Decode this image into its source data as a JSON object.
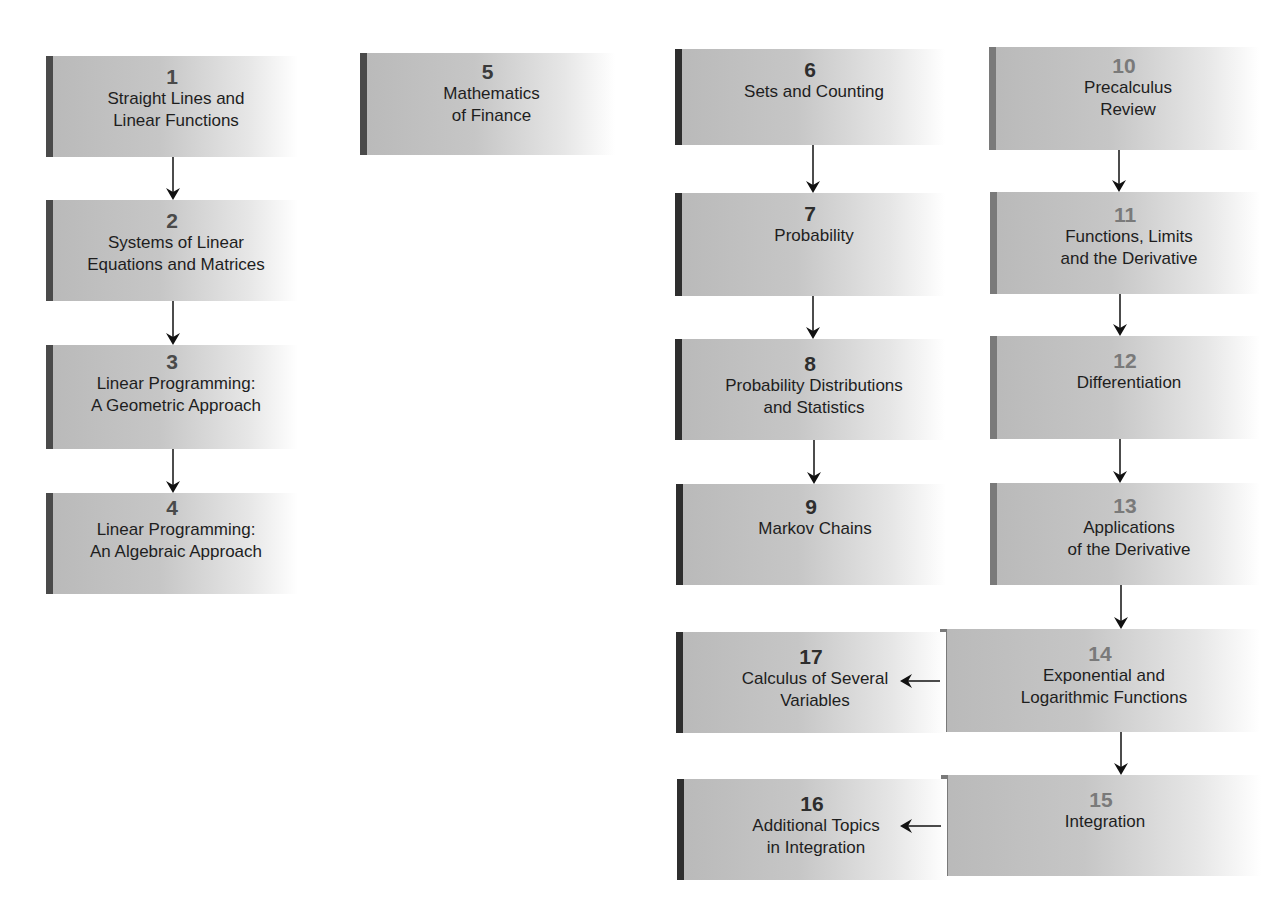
{
  "diagram": {
    "type": "chapter-dependency-flowchart",
    "nodes": [
      {
        "id": "1",
        "number": "1",
        "line1": "Straight Lines and",
        "line2": "Linear Functions",
        "group": "finite-a"
      },
      {
        "id": "2",
        "number": "2",
        "line1": "Systems of Linear",
        "line2": "Equations and Matrices",
        "group": "finite-a"
      },
      {
        "id": "3",
        "number": "3",
        "line1": "Linear Programming:",
        "line2": "A Geometric Approach",
        "group": "finite-a"
      },
      {
        "id": "4",
        "number": "4",
        "line1": "Linear Programming:",
        "line2": "An Algebraic Approach",
        "group": "finite-a"
      },
      {
        "id": "5",
        "number": "5",
        "line1": "Mathematics",
        "line2": "of Finance",
        "group": "finite-b"
      },
      {
        "id": "6",
        "number": "6",
        "line1": "Sets and Counting",
        "line2": "",
        "group": "finite-b"
      },
      {
        "id": "7",
        "number": "7",
        "line1": "Probability",
        "line2": "",
        "group": "finite-b"
      },
      {
        "id": "8",
        "number": "8",
        "line1": "Probability Distributions",
        "line2": "and Statistics",
        "group": "finite-b"
      },
      {
        "id": "9",
        "number": "9",
        "line1": "Markov Chains",
        "line2": "",
        "group": "finite-b"
      },
      {
        "id": "10",
        "number": "10",
        "line1": "Precalculus",
        "line2": "Review",
        "group": "calculus"
      },
      {
        "id": "11",
        "number": "11",
        "line1": "Functions, Limits",
        "line2": "and the Derivative",
        "group": "calculus"
      },
      {
        "id": "12",
        "number": "12",
        "line1": "Differentiation",
        "line2": "",
        "group": "calculus"
      },
      {
        "id": "13",
        "number": "13",
        "line1": "Applications",
        "line2": "of the Derivative",
        "group": "calculus"
      },
      {
        "id": "14",
        "number": "14",
        "line1": "Exponential and",
        "line2": "Logarithmic Functions",
        "group": "calculus"
      },
      {
        "id": "15",
        "number": "15",
        "line1": "Integration",
        "line2": "",
        "group": "calculus"
      },
      {
        "id": "16",
        "number": "16",
        "line1": "Additional Topics",
        "line2": "in Integration",
        "group": "calculus"
      },
      {
        "id": "17",
        "number": "17",
        "line1": "Calculus of Several",
        "line2": "Variables",
        "group": "calculus"
      }
    ],
    "edges": [
      {
        "from": "1",
        "to": "2"
      },
      {
        "from": "2",
        "to": "3"
      },
      {
        "from": "3",
        "to": "4"
      },
      {
        "from": "6",
        "to": "7"
      },
      {
        "from": "7",
        "to": "8"
      },
      {
        "from": "8",
        "to": "9"
      },
      {
        "from": "10",
        "to": "11"
      },
      {
        "from": "11",
        "to": "12"
      },
      {
        "from": "12",
        "to": "13"
      },
      {
        "from": "13",
        "to": "14"
      },
      {
        "from": "14",
        "to": "15"
      },
      {
        "from": "14",
        "to": "17"
      },
      {
        "from": "15",
        "to": "16"
      }
    ],
    "colors": {
      "bar_dark": "#3a3a3a",
      "bar_mid": "#6a6a6a",
      "bar_light": "#8a8a8a",
      "number_dark": "#3a3a3a",
      "number_light": "#7a7a7a",
      "arrow": "#111111"
    }
  }
}
